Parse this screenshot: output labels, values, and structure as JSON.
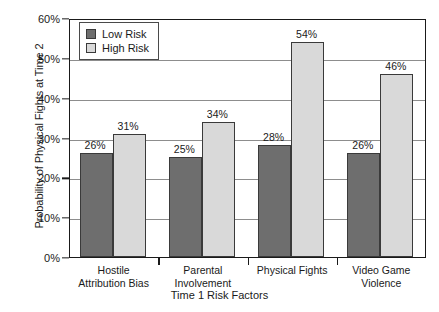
{
  "chart_data": {
    "type": "bar",
    "title": "",
    "xlabel": "Time 1 Risk Factors",
    "ylabel": "Probability of Physical Fights at Time 2",
    "categories": [
      "Hostile Attribution Bias",
      "Parental Involvement",
      "Physical Fights",
      "Video Game Violence"
    ],
    "category_lines": [
      [
        "Hostile",
        "Attribution Bias"
      ],
      [
        "Parental",
        "Involvement"
      ],
      [
        "Physical Fights",
        ""
      ],
      [
        "Video Game",
        "Violence"
      ]
    ],
    "series": [
      {
        "name": "Low Risk",
        "values": [
          26,
          25,
          28,
          26
        ],
        "color": "#6e6e6e"
      },
      {
        "name": "High Risk",
        "values": [
          31,
          34,
          54,
          46
        ],
        "color": "#d9d9d9"
      }
    ],
    "value_labels": {
      "low": [
        "26%",
        "25%",
        "28%",
        "26%"
      ],
      "high": [
        "31%",
        "34%",
        "54%",
        "46%"
      ]
    },
    "ylim": [
      0,
      60
    ],
    "ytick_values": [
      0,
      10,
      20,
      30,
      40,
      50,
      60
    ],
    "ytick_labels": [
      "0%",
      "10%",
      "20%",
      "30%",
      "40%",
      "50%",
      "60%"
    ],
    "grid": true,
    "legend_position": "top-left",
    "legend_entries": [
      "Low Risk",
      "High Risk"
    ]
  }
}
